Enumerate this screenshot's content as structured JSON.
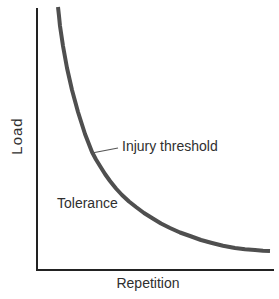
{
  "figure": {
    "background": "#ffffff",
    "text_color": "#2f2f2f",
    "labels": {
      "y_axis": "Load",
      "x_axis": "Repetition",
      "curve": "Injury threshold",
      "region_below_curve": "Tolerance"
    }
  },
  "chart_data": {
    "type": "line",
    "title": "",
    "xlabel": "Repetition",
    "ylabel": "Load",
    "x_range": [
      0,
      1
    ],
    "y_range": [
      0,
      1
    ],
    "ticks": "none",
    "grid": false,
    "legend": "none",
    "series": [
      {
        "name": "Injury threshold",
        "shape": "hyperbolic decay (load tolerance decreases as repetitions increase)",
        "x": [
          0.09,
          0.11,
          0.15,
          0.2,
          0.27,
          0.36,
          0.49,
          0.65,
          0.84,
          0.98
        ],
        "y": [
          1.0,
          0.86,
          0.69,
          0.52,
          0.4,
          0.29,
          0.2,
          0.13,
          0.08,
          0.07
        ]
      }
    ],
    "annotations": [
      {
        "text": "Injury threshold",
        "attached_to": "curve",
        "leader_line": true
      },
      {
        "text": "Tolerance",
        "position": "region below curve"
      }
    ],
    "render": {
      "canvas": {
        "width": 279,
        "height": 299
      },
      "axis_color": "#222222",
      "axis_width": 2,
      "curve_color": "#4f4f4f",
      "curve_width": 4,
      "leader_color": "#555555",
      "leader_width": 1.2,
      "y_axis": {
        "x1": 37,
        "y1": 8,
        "x2": 37,
        "y2": 271
      },
      "x_axis": {
        "x1": 36,
        "y1": 270,
        "x2": 274,
        "y2": 270
      },
      "leader_line": {
        "x1": 92,
        "y1": 153,
        "x2": 118,
        "y2": 148
      },
      "curve_points": [
        [
          58,
          7
        ],
        [
          59,
          16
        ],
        [
          60,
          26
        ],
        [
          61.5,
          36
        ],
        [
          63,
          46
        ],
        [
          65,
          57
        ],
        [
          67,
          68
        ],
        [
          69.5,
          79
        ],
        [
          72,
          90
        ],
        [
          75,
          101
        ],
        [
          78,
          112
        ],
        [
          81.5,
          123
        ],
        [
          85,
          134
        ],
        [
          88.5,
          143
        ],
        [
          92,
          152
        ],
        [
          96,
          159.5
        ],
        [
          100,
          166
        ],
        [
          105,
          174
        ],
        [
          110,
          181
        ],
        [
          116,
          188.5
        ],
        [
          122,
          195
        ],
        [
          129,
          201.5
        ],
        [
          136,
          207
        ],
        [
          144,
          213
        ],
        [
          152,
          218
        ],
        [
          161,
          223.5
        ],
        [
          170,
          228
        ],
        [
          180,
          232.5
        ],
        [
          190,
          236
        ],
        [
          201,
          240
        ],
        [
          212,
          243
        ],
        [
          223,
          245.8
        ],
        [
          235,
          248
        ],
        [
          245,
          249.3
        ],
        [
          255,
          250
        ],
        [
          263,
          250.7
        ],
        [
          270,
          251
        ]
      ]
    }
  }
}
